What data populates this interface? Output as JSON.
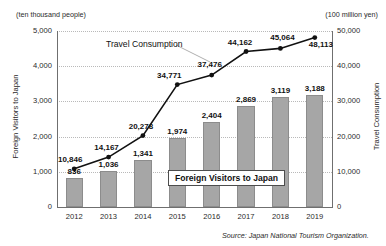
{
  "chart_data": {
    "type": "bar",
    "title": "",
    "categories": [
      "2012",
      "2013",
      "2014",
      "2015",
      "2016",
      "2017",
      "2018",
      "2019"
    ],
    "series": [
      {
        "name": "Foreign Visitors to Japan",
        "type": "bar",
        "axis": "left",
        "unit": "ten thousand people",
        "values": [
          836,
          1036,
          1341,
          1974,
          2404,
          2869,
          3119,
          3188
        ],
        "labels": [
          "836",
          "1,036",
          "1,341",
          "1,974",
          "2,404",
          "2,869",
          "3,119",
          "3,188"
        ]
      },
      {
        "name": "Travel Consumption",
        "type": "line",
        "axis": "right",
        "unit": "100 million yen",
        "values": [
          10846,
          14167,
          20278,
          34771,
          37476,
          44162,
          45064,
          48113
        ],
        "labels": [
          "10,846",
          "14,167",
          "20,278",
          "34,771",
          "37,476",
          "44,162",
          "45,064",
          "48,113"
        ]
      }
    ],
    "xlabel": "",
    "ylabel": "Foreign Visitors to Japan",
    "y2label": "Travel Consumption",
    "ylim": [
      0,
      5000
    ],
    "y2lim": [
      0,
      50000
    ],
    "yticks": [
      "0",
      "1,000",
      "2,000",
      "3,000",
      "4,000",
      "5,000"
    ],
    "y2ticks": [
      "0",
      "10,000",
      "20,000",
      "30,000",
      "40,000",
      "50,000"
    ],
    "grid": true,
    "legend_position": "inside-center",
    "colors": {
      "bar_fill": "#a6a6a6",
      "bar_border": "#8c8c8c",
      "line": "#111111",
      "grid": "#b9b9b9",
      "axis": "#6f6f6f",
      "text": "#1a1a1a"
    }
  },
  "units": {
    "left": "(ten thousand people)",
    "right": "(100 million yen)"
  },
  "axes": {
    "left_title": "Foreign Visitors to Japan",
    "right_title": "Travel Consumption"
  },
  "legend": {
    "bar_label": "Foreign Visitors to Japan"
  },
  "annotations": {
    "line_series_label": "Travel Consumption"
  },
  "footer": {
    "source": "Source: Japan National Tourism Organization."
  }
}
